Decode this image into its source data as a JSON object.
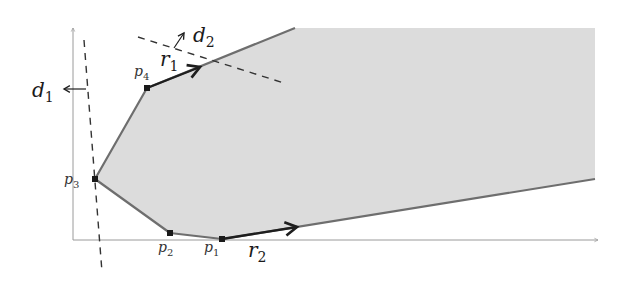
{
  "figure": {
    "colors": {
      "region_fill": "#dcdcdc",
      "region_edge": "#6e6e6e",
      "ray": "#1e1e1e",
      "dashed": "#333333",
      "axis": "#9a9a9a",
      "vertex": "#1a1a1a"
    },
    "axes": {
      "x_axis": {
        "x1": 73,
        "y1": 240,
        "x2": 598,
        "y2": 240
      },
      "y_axis": {
        "x1": 73,
        "y1": 240,
        "x2": 73,
        "y2": 28
      }
    },
    "vertices": [
      {
        "id": "p1",
        "label": "p",
        "sub": "1",
        "x": 222,
        "y": 239,
        "lx": 204,
        "ly": 252
      },
      {
        "id": "p2",
        "label": "p",
        "sub": "2",
        "x": 170,
        "y": 233,
        "lx": 158,
        "ly": 252
      },
      {
        "id": "p3",
        "label": "p",
        "sub": "3",
        "x": 95,
        "y": 179,
        "lx": 64,
        "ly": 184
      },
      {
        "id": "p4",
        "label": "p",
        "sub": "4",
        "x": 147,
        "y": 88,
        "lx": 134,
        "ly": 76
      }
    ],
    "region_polygon": "222,239 170,233 95,179 147,88 295,28 595,28 595,179",
    "edges": "295,28 147,88 95,179 170,233 222,239 595,179",
    "rays": [
      {
        "id": "r1",
        "label": "r",
        "sub": "1",
        "x1": 147,
        "y1": 88,
        "x2": 200,
        "y2": 67,
        "lx": 160,
        "ly": 66
      },
      {
        "id": "r2",
        "label": "r",
        "sub": "2",
        "x1": 222,
        "y1": 239,
        "x2": 297,
        "y2": 227,
        "lx": 248,
        "ly": 257
      }
    ],
    "directions": [
      {
        "id": "d1",
        "label": "d",
        "sub": "1",
        "line": {
          "x1": 84,
          "y1": 40,
          "x2": 102,
          "y2": 272
        },
        "arrow": {
          "x1": 86,
          "y1": 89,
          "x2": 64,
          "y2": 89
        },
        "lx": 32,
        "ly": 97
      },
      {
        "id": "d2",
        "label": "d",
        "sub": "2",
        "line": {
          "x1": 138,
          "y1": 37,
          "x2": 284,
          "y2": 83
        },
        "arrow": {
          "x1": 174,
          "y1": 48,
          "x2": 184,
          "y2": 33
        },
        "lx": 193,
        "ly": 42
      }
    ]
  }
}
